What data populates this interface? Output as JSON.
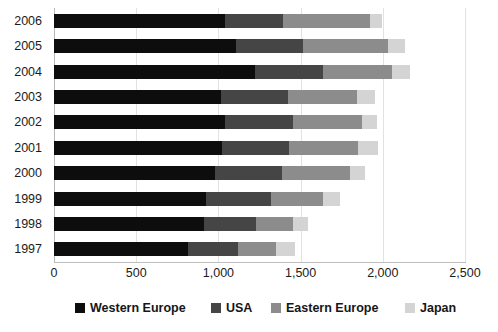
{
  "chart_data": {
    "type": "bar",
    "orientation": "horizontal",
    "stacked": true,
    "title": "",
    "subtitle": "",
    "xlabel": "",
    "ylabel": "",
    "xlim": [
      0,
      2500
    ],
    "ylim": null,
    "grid": true,
    "legend_position": "bottom",
    "categories": [
      "2006",
      "2005",
      "2004",
      "2003",
      "2002",
      "2001",
      "2000",
      "1999",
      "1998",
      "1997"
    ],
    "xticks": [
      0,
      500,
      1000,
      1500,
      2000,
      2500
    ],
    "xtick_labels": [
      "0",
      "500",
      "1,000",
      "1,500",
      "2,000",
      "2,500"
    ],
    "series": [
      {
        "name": "Western Europe",
        "color": "#0d0d0d",
        "values": [
          1040,
          1107,
          1222,
          1016,
          1040,
          1022,
          979,
          925,
          912,
          815
        ]
      },
      {
        "name": "USA",
        "color": "#454545",
        "values": [
          353,
          408,
          414,
          408,
          414,
          408,
          408,
          395,
          316,
          304
        ]
      },
      {
        "name": "Eastern Europe",
        "color": "#8c8c8c",
        "values": [
          530,
          517,
          420,
          420,
          420,
          420,
          414,
          316,
          225,
          231
        ]
      },
      {
        "name": "Japan",
        "color": "#d4d4d4",
        "values": [
          73,
          103,
          110,
          110,
          91,
          122,
          91,
          104,
          91,
          116
        ]
      }
    ],
    "totals": [
      1996,
      2135,
      2166,
      1954,
      1965,
      1972,
      1892,
      1740,
      1544,
      1466
    ]
  },
  "legend": {
    "items": [
      {
        "label": "Western Europe",
        "color": "#0d0d0d",
        "left": 75
      },
      {
        "label": "USA",
        "color": "#454545",
        "left": 211
      },
      {
        "label": "Eastern Europe",
        "color": "#8c8c8c",
        "left": 271
      },
      {
        "label": "Japan",
        "color": "#d4d4d4",
        "left": 405
      }
    ]
  },
  "axis_colors": {
    "gridline": "#e2e2e2",
    "axis": "#bdbdbd",
    "text": "#1b1b1b"
  }
}
